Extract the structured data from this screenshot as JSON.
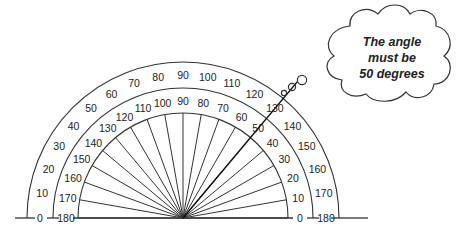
{
  "diagram": {
    "type": "protractor",
    "center": {
      "x": 183,
      "y": 218
    },
    "radii": {
      "inner_arc": 105,
      "middle_arc": 130,
      "outer_arc": 156
    },
    "outer_scale": {
      "label_radius": 143,
      "direction": "left-to-right",
      "labels": [
        "0",
        "10",
        "20",
        "30",
        "40",
        "50",
        "60",
        "70",
        "80",
        "90",
        "100",
        "110",
        "120",
        "130",
        "140",
        "150",
        "160",
        "170",
        "180"
      ]
    },
    "inner_scale": {
      "label_radius": 117,
      "direction": "right-to-left",
      "labels": [
        "0",
        "10",
        "20",
        "30",
        "40",
        "50",
        "60",
        "70",
        "80",
        "90",
        "100",
        "110",
        "120",
        "130",
        "140",
        "150",
        "160",
        "170",
        "180"
      ]
    },
    "ray_step_degrees": 10,
    "highlighted_ray": {
      "angle_degrees": 50,
      "length": 178
    },
    "baseline": {
      "left_x": 15,
      "right_x": 368
    }
  },
  "thought_bubble": {
    "lines": [
      "The angle",
      "must be",
      "50 degrees"
    ]
  },
  "colors": {
    "stroke": "#333333",
    "text": "#222222",
    "background": "#ffffff"
  }
}
